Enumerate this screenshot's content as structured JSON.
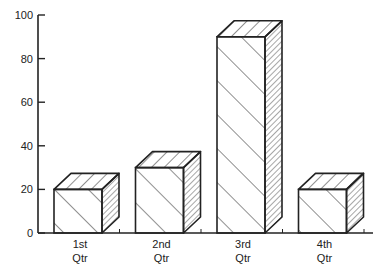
{
  "chart_data": {
    "type": "bar",
    "style": "3d-hatched",
    "title": "",
    "xlabel": "",
    "ylabel": "",
    "categories": [
      "1st Qtr",
      "2nd Qtr",
      "3rd Qtr",
      "4th Qtr"
    ],
    "category_lines": [
      [
        "1st",
        "Qtr"
      ],
      [
        "2nd",
        "Qtr"
      ],
      [
        "3rd",
        "Qtr"
      ],
      [
        "4th",
        "Qtr"
      ]
    ],
    "values": [
      20,
      30,
      90,
      20
    ],
    "ylim": [
      0,
      100
    ],
    "yticks": [
      0,
      20,
      40,
      60,
      80,
      100
    ],
    "grid": false,
    "legend": null
  },
  "colors": {
    "line": "#222222",
    "fill": "#ffffff"
  }
}
